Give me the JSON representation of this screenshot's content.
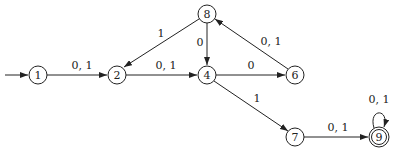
{
  "diagram": {
    "type": "finite-automaton",
    "start_state": "1",
    "accepting_states": [
      "9"
    ],
    "states": [
      {
        "id": "1",
        "label": "1",
        "x": 38,
        "y": 75,
        "accepting": false
      },
      {
        "id": "2",
        "label": "2",
        "x": 117,
        "y": 75,
        "accepting": false
      },
      {
        "id": "4",
        "label": "4",
        "x": 207,
        "y": 75,
        "accepting": false
      },
      {
        "id": "6",
        "label": "6",
        "x": 295,
        "y": 75,
        "accepting": false
      },
      {
        "id": "8",
        "label": "8",
        "x": 207,
        "y": 14,
        "accepting": false
      },
      {
        "id": "7",
        "label": "7",
        "x": 295,
        "y": 137,
        "accepting": false
      },
      {
        "id": "9",
        "label": "9",
        "x": 379,
        "y": 137,
        "accepting": true
      }
    ],
    "transitions": [
      {
        "from": "1",
        "to": "2",
        "label": "0, 1"
      },
      {
        "from": "2",
        "to": "4",
        "label": "0, 1"
      },
      {
        "from": "8",
        "to": "2",
        "label": "1"
      },
      {
        "from": "8",
        "to": "4",
        "label": "0"
      },
      {
        "from": "4",
        "to": "6",
        "label": "0"
      },
      {
        "from": "6",
        "to": "8",
        "label": "0, 1"
      },
      {
        "from": "4",
        "to": "7",
        "label": "1"
      },
      {
        "from": "7",
        "to": "9",
        "label": "0, 1"
      },
      {
        "from": "9",
        "to": "9",
        "label": "0, 1"
      }
    ]
  }
}
